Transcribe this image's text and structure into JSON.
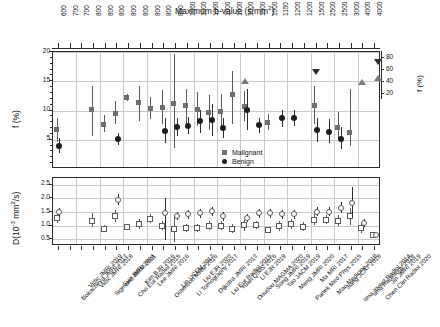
{
  "figure": {
    "top_axis_title_pre": "Maximum b-value (s/mm",
    "top_axis_title_sup": "2",
    "top_axis_title_post": ")",
    "left_axis_top_label": "f (%)",
    "left_axis_bottom_pre": "D(10",
    "left_axis_bottom_sup1": "-3",
    "left_axis_bottom_mid": " mm",
    "left_axis_bottom_sup2": "2",
    "left_axis_bottom_post": "/s)",
    "right_axis_label": "f (%)"
  },
  "legend": {
    "position": "inside-center",
    "items": [
      {
        "label": "Malignant",
        "marker": "square",
        "color": "#6f6f6f"
      },
      {
        "label": "Benign",
        "marker": "circle",
        "color": "#1e1e1e"
      }
    ]
  },
  "colors": {
    "malignant": "#6f6f6f",
    "benign": "#1e1e1e",
    "grid": "#c9c9c9",
    "frame": "#2b2b2b",
    "open_marker_edge": "#5a5a5a"
  },
  "chart_data": {
    "type": "scatter",
    "title": "Maximum b-value (s/mm2)",
    "xlabel": "",
    "ylabel": "f (%)  /  D(10-3 mm2/s)",
    "grid": true,
    "legend_position": "center",
    "panels": [
      {
        "name": "perfusion-fraction-panel",
        "ylabel": "f (%)",
        "ylim": [
          0,
          20
        ],
        "yticks": [
          5,
          10,
          15,
          20
        ],
        "secondary_axis": {
          "label": "f (%)",
          "ticks": [
            20,
            40,
            60,
            80
          ],
          "ylim": [
            10,
            90
          ]
        }
      },
      {
        "name": "diffusion-coefficient-panel",
        "ylabel": "D(10-3 mm2/s)",
        "ylim": [
          0.25,
          2.75
        ],
        "yticks": [
          0.5,
          1.0,
          1.5,
          2.0,
          2.5
        ]
      }
    ],
    "categories": [
      "Bokacheva JMRI 2013",
      "Vidic JMRI 2019",
      "Vidic JMRI 2018",
      "Sigmund MRM 2011",
      "Suo JMRI 2014",
      "Cho Eur Radiol 2015",
      "Kim BJR 2016",
      "Lee JMRI 2016",
      "Ostenson MRM 2016",
      "Lin IJCEM 2017",
      "Li Tomography 2017",
      "Liu EJR 2020",
      "Dijkstra JMRI 2013",
      "Liu Eur Radiol 2015",
      "Yuan QIMS 2016",
      "Doudou MAGMA 2020",
      "Li EJR 2019",
      "Song JMRI 2019",
      "Tao JACM 2019",
      "Meng JMRI 2020",
      "Panek Med Phys 2015",
      "Ma MRI 2017",
      "Mao Medicine 2018",
      "Jiang JCAT 2018",
      "Iima Invest Radiol 2014",
      "Iima Radiology 2018",
      "Chen Clin Radiol 2020",
      "Jin JMRI 2019"
    ],
    "bvalues": [
      600,
      700,
      700,
      800,
      800,
      800,
      800,
      800,
      800,
      800,
      800,
      1000,
      1000,
      1000,
      1000,
      1000,
      1000,
      1000,
      1000,
      1150,
      1200,
      1200,
      1500,
      2500,
      2500,
      3000,
      4000,
      4000
    ],
    "series": [
      {
        "name": "Malignant",
        "panel": "f (%)",
        "marker": "filled-square",
        "values": [
          6.5,
          null,
          null,
          10.0,
          7.5,
          9.3,
          12.0,
          11.2,
          10.2,
          10.4,
          11.0,
          10.7,
          10.0,
          9.5,
          9.7,
          12.5,
          10.5,
          null,
          7.8,
          null,
          null,
          null,
          10.6,
          null,
          7.0,
          6.0,
          null,
          null
        ],
        "err_low": [
          4.5,
          null,
          null,
          5.5,
          6.2,
          7.6,
          11.4,
          8.0,
          8.3,
          7.5,
          3.5,
          7.6,
          7.2,
          6.5,
          6.5,
          7.5,
          8.0,
          null,
          6.5,
          null,
          null,
          null,
          7.5,
          null,
          5.0,
          3.8,
          null,
          null
        ],
        "err_high": [
          8.5,
          null,
          null,
          14.0,
          9.0,
          11.5,
          12.6,
          14.0,
          12.2,
          13.3,
          19.5,
          13.5,
          13.0,
          12.4,
          12.7,
          16.5,
          13.2,
          null,
          9.2,
          null,
          null,
          null,
          14.0,
          null,
          9.5,
          13.5,
          null,
          null
        ]
      },
      {
        "name": "Benign",
        "panel": "f (%)",
        "marker": "filled-circle",
        "values": [
          3.8,
          null,
          null,
          null,
          null,
          5.0,
          null,
          null,
          null,
          6.4,
          7.0,
          7.2,
          8.0,
          8.2,
          6.8,
          null,
          10.0,
          7.3,
          null,
          8.5,
          8.5,
          null,
          6.5,
          6.2,
          5.0,
          null,
          null,
          null
        ],
        "err_low": [
          2.5,
          null,
          null,
          null,
          null,
          4.0,
          null,
          null,
          null,
          4.2,
          5.5,
          5.8,
          6.0,
          5.5,
          5.2,
          null,
          6.5,
          6.0,
          null,
          7.0,
          7.2,
          null,
          4.5,
          4.2,
          3.2,
          null,
          null,
          null
        ],
        "err_high": [
          5.2,
          null,
          null,
          null,
          null,
          6.0,
          null,
          null,
          null,
          8.6,
          8.5,
          8.8,
          10.0,
          11.0,
          8.5,
          null,
          13.5,
          8.6,
          null,
          10.0,
          10.0,
          null,
          8.5,
          8.4,
          7.0,
          null,
          null,
          null
        ]
      },
      {
        "name": "Malignant",
        "panel": "D",
        "marker": "open-square",
        "values": [
          1.25,
          null,
          null,
          1.15,
          0.85,
          1.32,
          0.92,
          1.02,
          1.22,
          0.95,
          0.82,
          0.88,
          0.88,
          0.95,
          0.95,
          0.85,
          0.97,
          1.0,
          0.8,
          0.95,
          1.02,
          0.92,
          1.18,
          1.18,
          1.15,
          1.3,
          0.88,
          0.62
        ],
        "err_low": [
          1.05,
          null,
          null,
          0.9,
          0.72,
          1.1,
          0.82,
          0.85,
          1.05,
          0.8,
          0.35,
          0.72,
          0.72,
          0.8,
          0.8,
          0.68,
          0.78,
          0.85,
          0.7,
          0.78,
          0.85,
          0.76,
          1.0,
          1.02,
          0.95,
          1.0,
          0.7,
          0.52
        ],
        "err_high": [
          1.48,
          null,
          null,
          1.42,
          1.0,
          1.55,
          1.02,
          1.2,
          1.4,
          1.12,
          1.32,
          1.04,
          1.04,
          1.12,
          1.12,
          1.02,
          1.16,
          1.15,
          0.92,
          1.12,
          1.2,
          1.08,
          1.38,
          1.35,
          1.35,
          1.62,
          1.05,
          0.72
        ]
      },
      {
        "name": "Benign",
        "panel": "D",
        "marker": "open-circle",
        "values": [
          1.45,
          null,
          null,
          null,
          null,
          1.9,
          null,
          null,
          null,
          1.42,
          1.32,
          1.38,
          1.42,
          1.5,
          1.3,
          null,
          1.25,
          1.42,
          1.42,
          1.38,
          1.38,
          null,
          1.48,
          1.48,
          1.62,
          1.8,
          1.05,
          0.62
        ],
        "err_low": [
          1.28,
          null,
          null,
          null,
          null,
          1.72,
          null,
          null,
          null,
          0.42,
          1.18,
          1.22,
          1.25,
          1.32,
          1.15,
          null,
          1.1,
          1.26,
          1.26,
          1.22,
          1.22,
          null,
          1.3,
          1.3,
          1.42,
          1.28,
          0.9,
          0.55
        ],
        "err_high": [
          1.6,
          null,
          null,
          null,
          null,
          2.12,
          null,
          null,
          null,
          1.98,
          1.48,
          1.52,
          1.58,
          1.66,
          1.45,
          null,
          1.4,
          1.58,
          1.58,
          1.55,
          1.55,
          null,
          1.65,
          1.65,
          1.82,
          2.38,
          1.22,
          0.7
        ]
      },
      {
        "name": "Malignant-secondary-axis",
        "panel": "f (%) right",
        "marker": "filled-triangle-up",
        "values": [
          null,
          null,
          null,
          null,
          null,
          null,
          null,
          null,
          null,
          null,
          null,
          null,
          null,
          null,
          null,
          null,
          40,
          null,
          null,
          null,
          null,
          null,
          null,
          null,
          null,
          null,
          38,
          null
        ]
      },
      {
        "name": "Benign-secondary-axis",
        "panel": "f (%) right",
        "marker": "filled-triangle-down",
        "values": [
          null,
          null,
          null,
          null,
          null,
          null,
          null,
          null,
          null,
          null,
          null,
          null,
          null,
          null,
          null,
          null,
          null,
          null,
          null,
          null,
          null,
          null,
          55,
          null,
          null,
          null,
          null,
          null
        ]
      }
    ]
  }
}
